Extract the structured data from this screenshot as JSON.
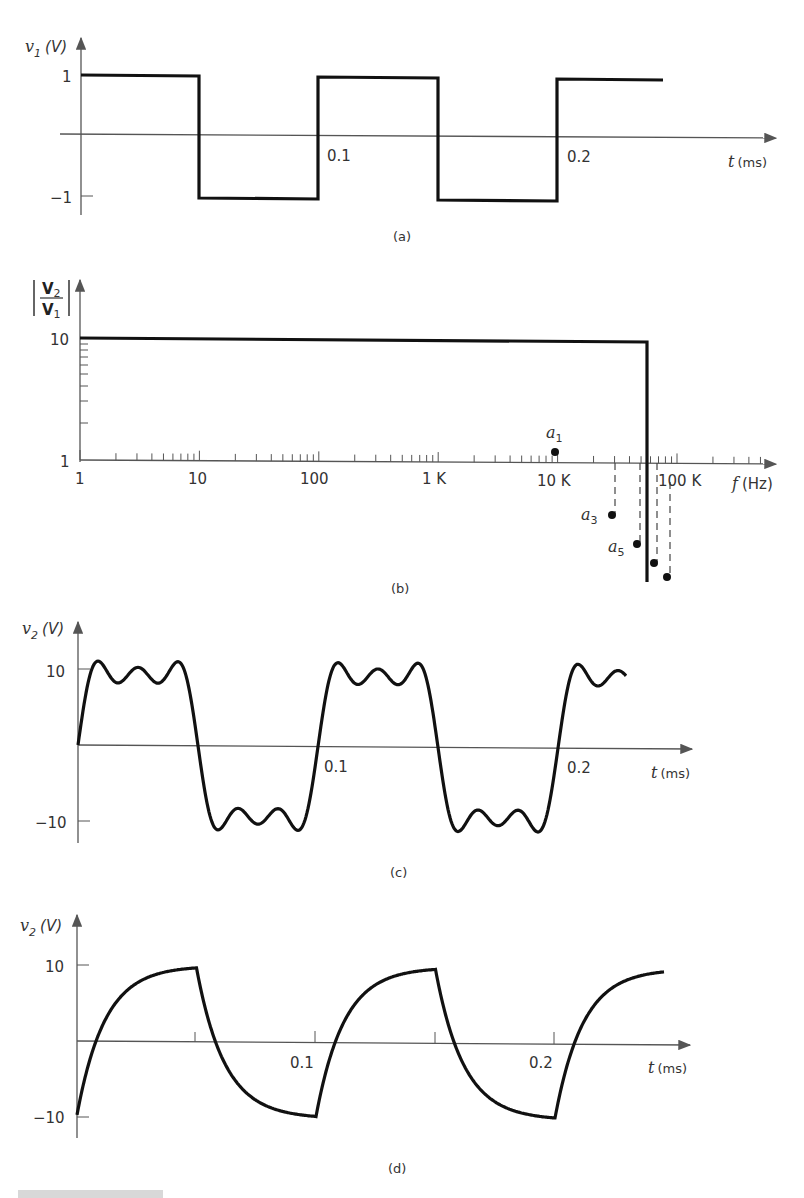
{
  "chart_data": [
    {
      "panel": "a",
      "type": "line",
      "title": "(a)",
      "ylabel": "v1 (V)",
      "xlabel": "t (ms)",
      "x_ticks": [
        "0.1",
        "0.2"
      ],
      "y_ticks": [
        "1",
        "-1"
      ],
      "ylim": [
        -1,
        1
      ],
      "description": "Square wave input, amplitude ±1 V, period 0.1 ms",
      "x": [
        0,
        0.05,
        0.05,
        0.1,
        0.1,
        0.15,
        0.15,
        0.2,
        0.2,
        0.245
      ],
      "y": [
        1,
        1,
        -1,
        -1,
        1,
        1,
        -1,
        -1,
        1,
        1
      ]
    },
    {
      "panel": "b",
      "type": "line",
      "title": "(b)",
      "ylabel": "|V2/V1|",
      "xlabel": "f (Hz)",
      "xscale": "log",
      "yscale": "log",
      "x_ticks": [
        "1",
        "10",
        "100",
        "1 K",
        "10 K",
        "100 K"
      ],
      "y_ticks": [
        "10",
        "1"
      ],
      "description": "Ideal low-pass filter, gain 10, cutoff approx. 50 kHz",
      "x": [
        1,
        50000,
        50000
      ],
      "y": [
        10,
        10,
        0
      ],
      "annotations": [
        {
          "label": "a1",
          "f": 10000,
          "position": "above axis"
        },
        {
          "label": "a3",
          "f": 30000,
          "position": "below axis"
        },
        {
          "label": "a5",
          "f": 50000,
          "position": "below axis"
        },
        {
          "label": "",
          "f": 70000,
          "position": "below axis"
        },
        {
          "label": "",
          "f": 90000,
          "position": "below axis"
        }
      ]
    },
    {
      "panel": "c",
      "type": "line",
      "title": "(c)",
      "ylabel": "v2 (V)",
      "xlabel": "t (ms)",
      "x_ticks": [
        "0.1",
        "0.2"
      ],
      "y_ticks": [
        "10",
        "-10"
      ],
      "ylim": [
        -10,
        10
      ],
      "description": "Output: sum of 1st, 3rd, 5th harmonics — square wave with ripple, amplitude ~10 V"
    },
    {
      "panel": "d",
      "type": "line",
      "title": "(d)",
      "ylabel": "v2 (V)",
      "xlabel": "t (ms)",
      "x_ticks": [
        "0.1",
        "0.2"
      ],
      "y_ticks": [
        "10",
        "-10"
      ],
      "ylim": [
        -10,
        10
      ],
      "description": "Output: exponential charge/discharge (RC-like) response, amplitude ~10 V"
    }
  ],
  "labels": {
    "a": {
      "ylabel_var": "v",
      "ylabel_sub": "1",
      "ylabel_unit": "(V)",
      "y_pos": "1",
      "y_neg": "−1",
      "x_t1": "0.1",
      "x_t2": "0.2",
      "xlabel_var": "t",
      "xlabel_unit": "(ms)",
      "caption": "(a)"
    },
    "b": {
      "num": "V",
      "num_sub": "2",
      "den": "V",
      "den_sub": "1",
      "y_top": "10",
      "y_bot": "1",
      "x_ticks": [
        "1",
        "10",
        "100",
        "1 K",
        "10 K",
        "100 K"
      ],
      "xlabel_var": "f",
      "xlabel_unit": "(Hz)",
      "a1": "a",
      "a1_sub": "1",
      "a3": "a",
      "a3_sub": "3",
      "a5": "a",
      "a5_sub": "5",
      "caption": "(b)"
    },
    "c": {
      "ylabel_var": "v",
      "ylabel_sub": "2",
      "ylabel_unit": "(V)",
      "y_pos": "10",
      "y_neg": "−10",
      "x_t1": "0.1",
      "x_t2": "0.2",
      "xlabel_var": "t",
      "xlabel_unit": "(ms)",
      "caption": "(c)"
    },
    "d": {
      "ylabel_var": "v",
      "ylabel_sub": "2",
      "ylabel_unit": "(V)",
      "y_pos": "10",
      "y_neg": "−10",
      "x_t1": "0.1",
      "x_t2": "0.2",
      "xlabel_var": "t",
      "xlabel_unit": "(ms)",
      "caption": "(d)"
    }
  }
}
